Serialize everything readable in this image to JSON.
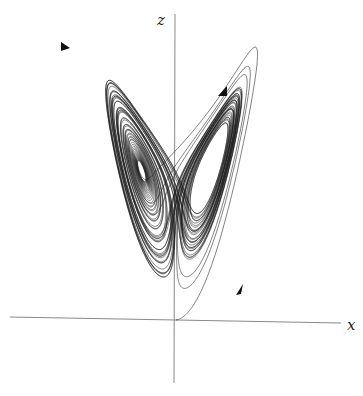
{
  "figure": {
    "type": "lorenz-attractor",
    "axes": {
      "z_label": "z",
      "x_label": "x"
    },
    "parameters": {
      "sigma": 10,
      "rho": 28,
      "beta": 2.6666667,
      "initial_state": [
        0.01,
        0.0,
        0.0
      ]
    },
    "colors": {
      "trajectory": "#1a1a1a",
      "axes": "#6a6a6a",
      "background": "#ffffff"
    },
    "direction_arrows": 4
  }
}
